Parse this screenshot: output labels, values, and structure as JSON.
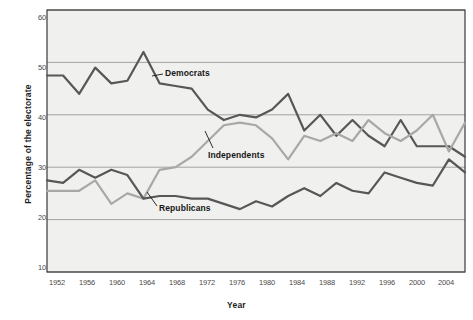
{
  "chart_data": {
    "type": "line",
    "title": "",
    "xlabel": "Year",
    "ylabel": "Percentage of the electorate",
    "xlim": [
      1952,
      2004
    ],
    "ylim": [
      10,
      60
    ],
    "yticks": [
      60,
      50,
      40,
      30,
      20,
      10
    ],
    "xticks": [
      1952,
      1956,
      1960,
      1964,
      1968,
      1972,
      1976,
      1980,
      1984,
      1988,
      1992,
      1996,
      2000,
      2004
    ],
    "grid": true,
    "legend_position": "inline-annotations",
    "x": [
      1952,
      1954,
      1956,
      1958,
      1960,
      1962,
      1964,
      1966,
      1968,
      1970,
      1972,
      1974,
      1976,
      1978,
      1980,
      1982,
      1984,
      1986,
      1988,
      1990,
      1992,
      1994,
      1996,
      1998,
      2000,
      2002,
      2004
    ],
    "series": [
      {
        "name": "Democrats",
        "color": "#575757",
        "values": [
          47.5,
          47.5,
          44.0,
          49.0,
          46.0,
          46.5,
          52.0,
          46.0,
          45.5,
          45.0,
          41.0,
          39.0,
          40.0,
          39.5,
          41.0,
          44.0,
          37.0,
          40.0,
          36.0,
          39.0,
          36.0,
          34.0,
          39.0,
          34.0,
          34.0,
          34.0,
          32.0
        ]
      },
      {
        "name": "Independents",
        "color": "#a8a8a8",
        "values": [
          25.5,
          25.5,
          25.5,
          27.5,
          23.0,
          25.0,
          24.0,
          29.5,
          30.0,
          32.0,
          35.0,
          38.0,
          38.5,
          38.0,
          35.5,
          31.5,
          36.0,
          35.0,
          36.5,
          35.0,
          39.0,
          36.5,
          35.0,
          37.0,
          40.0,
          33.0,
          38.5
        ]
      },
      {
        "name": "Republicans",
        "color": "#575757",
        "values": [
          27.5,
          27.0,
          29.5,
          28.0,
          29.5,
          28.5,
          24.0,
          24.5,
          24.5,
          24.0,
          24.0,
          23.0,
          22.0,
          23.5,
          22.5,
          24.5,
          26.0,
          24.5,
          27.0,
          25.5,
          25.0,
          29.0,
          28.0,
          27.0,
          26.5,
          31.5,
          29.0
        ]
      }
    ],
    "annotations": [
      {
        "label": "Democrats",
        "series": "Democrats"
      },
      {
        "label": "Independents",
        "series": "Independents"
      },
      {
        "label": "Republicans",
        "series": "Republicans"
      }
    ]
  },
  "axis": {
    "y_title": "Percentage of the electorate",
    "x_title": "Year",
    "y_tick_labels": [
      "60",
      "50",
      "40",
      "30",
      "20",
      "10"
    ],
    "x_tick_labels": [
      "1952",
      "1956",
      "1960",
      "1964",
      "1968",
      "1972",
      "1976",
      "1980",
      "1984",
      "1988",
      "1992",
      "1996",
      "2000",
      "2004"
    ]
  },
  "labels": {
    "democrats": "Democrats",
    "independents": "Independents",
    "republicans": "Republicans"
  },
  "colors": {
    "dark_line": "#575757",
    "light_line": "#a8a8a8",
    "grid": "#9a9a9a",
    "plot_bg": "#f0f0ee",
    "frame": "#3a3a3a",
    "text": "#1d1d1d",
    "tick_text": "#4a4a4a"
  }
}
